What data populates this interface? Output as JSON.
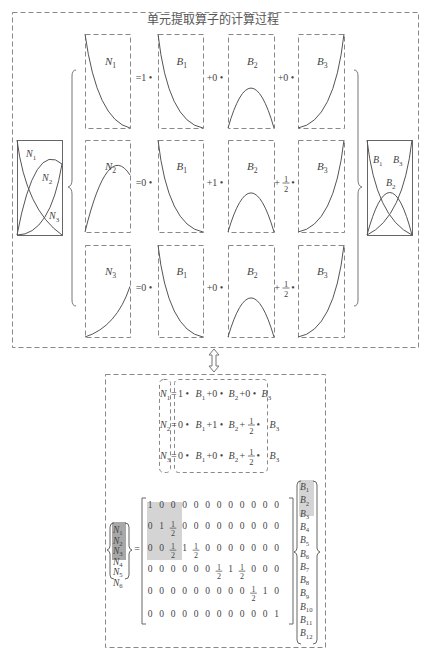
{
  "title": "单元提取算子的计算过程",
  "colors": {
    "line": "#555555",
    "dash": "#888888",
    "highlight_light": "#d4d4d4",
    "highlight_dark": "#a8a8a8"
  },
  "left_panel": {
    "labels": [
      "N1",
      "N2",
      "N3"
    ]
  },
  "right_panel": {
    "labels": [
      "B1",
      "B3",
      "B2"
    ]
  },
  "columns": {
    "n_labels": [
      "N1",
      "N2",
      "N3"
    ],
    "b_labels": [
      "B1",
      "B2",
      "B3"
    ]
  },
  "rows": [
    {
      "n": "N1",
      "c1": "=1 •",
      "c2": "+0 •",
      "c3": "+0 •"
    },
    {
      "n": "N2",
      "c1": "=0 •",
      "c2": "+1 •",
      "c3": "+ 1/2 •"
    },
    {
      "n": "N3",
      "c1": "=0 •",
      "c2": "+0 •",
      "c3": "+ 1/2 •"
    }
  ],
  "equations": [
    {
      "lhs": "N1",
      "rhs": "1 • B1+0 • B2+0 • B3"
    },
    {
      "lhs": "N2",
      "rhs": "0 • B1+1 • B2+ 1/2 • B3"
    },
    {
      "lhs": "N3",
      "rhs": "0 • B1+0 • B2+ 1/2 • B3"
    }
  ],
  "matrix": {
    "lhs": [
      "N1",
      "N2",
      "N3",
      "N4",
      "N5",
      "N6"
    ],
    "rows": [
      [
        "1",
        "0",
        "0",
        "0",
        "0",
        "0",
        "0",
        "0",
        "0",
        "0",
        "0",
        "0"
      ],
      [
        "0",
        "1",
        "1/2",
        "0",
        "0",
        "0",
        "0",
        "0",
        "0",
        "0",
        "0",
        "0"
      ],
      [
        "0",
        "0",
        "1/2",
        "1",
        "1/2",
        "0",
        "0",
        "0",
        "0",
        "0",
        "0",
        "0"
      ],
      [
        "0",
        "0",
        "0",
        "0",
        "0",
        "0",
        "1/2",
        "1",
        "1/2",
        "0",
        "0",
        "0"
      ],
      [
        "0",
        "0",
        "0",
        "0",
        "0",
        "0",
        "0",
        "0",
        "0",
        "1/2",
        "1",
        "0"
      ],
      [
        "0",
        "0",
        "0",
        "0",
        "0",
        "0",
        "0",
        "0",
        "0",
        "0",
        "0",
        "1"
      ]
    ],
    "rhs": [
      "B1",
      "B2",
      "B3",
      "B4",
      "B5",
      "B6",
      "B7",
      "B8",
      "B9",
      "B10",
      "B11",
      "B12"
    ]
  },
  "arrow": "double-vertical-arrow"
}
